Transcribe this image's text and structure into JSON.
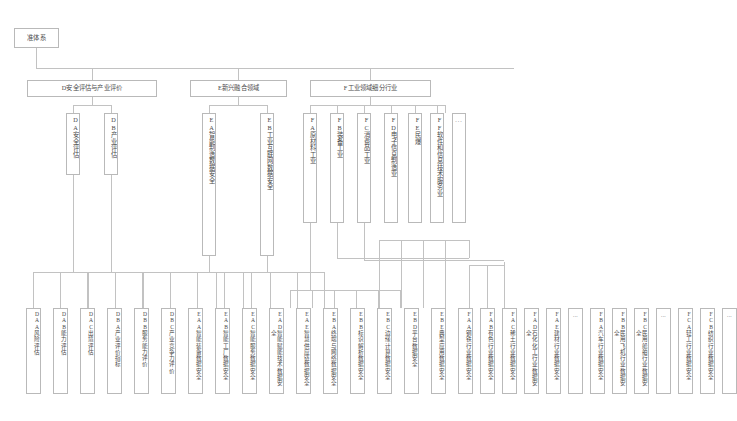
{
  "diagram": {
    "root": {
      "id": "root",
      "label": "准体系"
    },
    "level2": [
      {
        "id": "D",
        "label": "D安全评估与产业评价"
      },
      {
        "id": "E",
        "label": "E新兴融合领域"
      },
      {
        "id": "F",
        "label": "F工业领域细分行业"
      }
    ],
    "level3": [
      {
        "id": "DA",
        "code": "DA",
        "label": "安全评估",
        "parent": "D"
      },
      {
        "id": "DB",
        "code": "DB",
        "label": "产业评估",
        "parent": "D"
      },
      {
        "id": "EA",
        "code": "EA",
        "label": "智能制造数据安全",
        "parent": "E"
      },
      {
        "id": "EB",
        "code": "EB",
        "label": "工业互联网数据安全",
        "parent": "E"
      },
      {
        "id": "FA",
        "code": "FA",
        "label": "原材料工业",
        "parent": "F"
      },
      {
        "id": "FB",
        "code": "FB",
        "label": "装备工业",
        "parent": "F"
      },
      {
        "id": "FC",
        "code": "FC",
        "label": "消费品工业",
        "parent": "F"
      },
      {
        "id": "FD",
        "code": "FD",
        "label": "电子信息制造业",
        "parent": "F"
      },
      {
        "id": "FE",
        "code": "FE",
        "label": "民爆",
        "parent": "F"
      },
      {
        "id": "FF",
        "code": "FF",
        "label": "软件和信息技术服务业",
        "parent": "F"
      },
      {
        "id": "F_ell",
        "code": "",
        "label": "...",
        "parent": "F",
        "ellipsis": true
      }
    ],
    "leaves": [
      {
        "id": "DAA",
        "code": "DA\nA",
        "label": "风险评估",
        "parent": "DA"
      },
      {
        "id": "DAB",
        "code": "DA\nB",
        "label": "能力评估",
        "parent": "DA"
      },
      {
        "id": "DAC",
        "code": "DA\nC",
        "label": "出境评估",
        "parent": "DA"
      },
      {
        "id": "DBA",
        "code": "DB\nA",
        "label": "产业评价指标",
        "parent": "DB"
      },
      {
        "id": "DBB",
        "code": "DB\nB",
        "label": "服务能力评价",
        "parent": "DB"
      },
      {
        "id": "DBC",
        "code": "DB\nC",
        "label": "产业竞争力评价",
        "parent": "DB"
      },
      {
        "id": "EAA",
        "code": "EA\nA",
        "label": "智能装备数据安全",
        "parent": "EA"
      },
      {
        "id": "EAB",
        "code": "EA\nB",
        "label": "智能工厂数据安全",
        "parent": "EA"
      },
      {
        "id": "EAC",
        "code": "EA\nC",
        "label": "智能服务数据安全",
        "parent": "EA"
      },
      {
        "id": "EAD",
        "code": "EA\nD",
        "label": "智能赋能技术数据安全",
        "parent": "EA"
      },
      {
        "id": "EAE",
        "code": "EA\nE",
        "label": "智慧供应链数据安全",
        "parent": "EA"
      },
      {
        "id": "EBA",
        "code": "EB\nA",
        "label": "终端与网络数据安全",
        "parent": "EB"
      },
      {
        "id": "EBB",
        "code": "EB\nB",
        "label": "标识解析数据安全",
        "parent": "EB"
      },
      {
        "id": "EBC",
        "code": "EB\nC",
        "label": "边缘计算数据安全",
        "parent": "EB"
      },
      {
        "id": "EBD",
        "code": "EB\nD",
        "label": "平台数据安全",
        "parent": "EB"
      },
      {
        "id": "EBE",
        "code": "EB\nE",
        "label": "典型应用数据安全",
        "parent": "EB"
      },
      {
        "id": "FAA",
        "code": "FA\nA",
        "label": "钢铁行业数据安全",
        "parent": "FA"
      },
      {
        "id": "FAB",
        "code": "FA\nB",
        "label": "有色行业数据安全",
        "parent": "FA"
      },
      {
        "id": "FAC",
        "code": "FA\nC",
        "label": "稀土行业数据安全",
        "parent": "FA"
      },
      {
        "id": "FAD",
        "code": "FA\nD",
        "label": "石化化工行业数据安全",
        "parent": "FA"
      },
      {
        "id": "FAE",
        "code": "FA\nE",
        "label": "建材行业数据安全",
        "parent": "FA"
      },
      {
        "id": "FA_ell",
        "code": "",
        "label": "...",
        "parent": "FA",
        "ellipsis": true
      },
      {
        "id": "FBA",
        "code": "FB\nA",
        "label": "汽车行业数据安全",
        "parent": "FB"
      },
      {
        "id": "FBB",
        "code": "FB\nB",
        "label": "民用飞机行业数据安全",
        "parent": "FB"
      },
      {
        "id": "FBC",
        "code": "FB\nC",
        "label": "民用船舶行业数据安全",
        "parent": "FB"
      },
      {
        "id": "FB_ell",
        "code": "",
        "label": "...",
        "parent": "FB",
        "ellipsis": true
      },
      {
        "id": "FCA",
        "code": "FC\nA",
        "label": "轻工行业数据安全",
        "parent": "FC"
      },
      {
        "id": "FCB",
        "code": "FC\nB",
        "label": "纺织行业数据安全",
        "parent": "FC"
      },
      {
        "id": "FC_ell",
        "code": "",
        "label": "...",
        "parent": "FC",
        "ellipsis": true
      }
    ]
  }
}
